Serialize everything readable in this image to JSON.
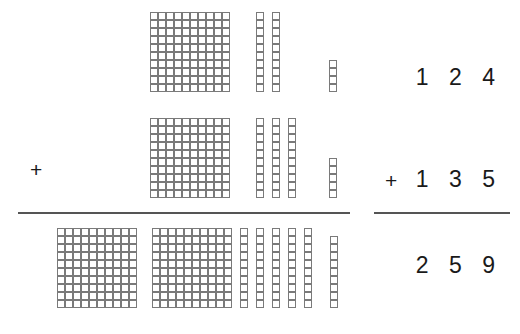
{
  "worksheet": {
    "type": "base-ten-blocks-addition",
    "operation": "addition",
    "ink_color": "#1a1a1a",
    "block_stroke_color": "#7a7a7a",
    "rule_color": "#555555"
  },
  "left_operator": {
    "symbol": "+"
  },
  "rows": [
    {
      "id": "addend-1",
      "role": "addend",
      "value": 124,
      "hundreds": 1,
      "tens": 2,
      "ones": 4,
      "numeral_text": "1 2 4",
      "operator_text": ""
    },
    {
      "id": "addend-2",
      "role": "addend",
      "value": 135,
      "hundreds": 1,
      "tens": 3,
      "ones": 5,
      "numeral_text": "1 3 5",
      "operator_text": "+"
    },
    {
      "id": "sum",
      "role": "sum",
      "value": 259,
      "hundreds": 2,
      "tens": 5,
      "ones": 9,
      "numeral_text": "2 5 9",
      "operator_text": ""
    }
  ],
  "chart_data": {
    "type": "table",
    "title": "124 + 135 = 259",
    "categories": [
      "hundreds",
      "tens",
      "ones"
    ],
    "series": [
      {
        "name": "124",
        "values": [
          1,
          2,
          4
        ]
      },
      {
        "name": "135",
        "values": [
          1,
          3,
          5
        ]
      },
      {
        "name": "259",
        "values": [
          2,
          5,
          9
        ]
      }
    ]
  }
}
